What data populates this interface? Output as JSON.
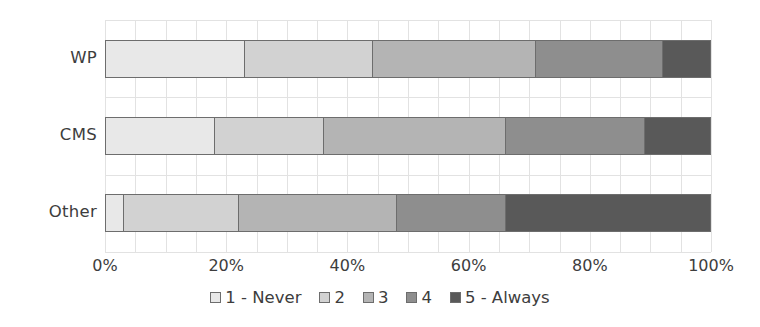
{
  "chart_data": {
    "type": "bar",
    "subtype": "stacked-horizontal-100pct",
    "title": "",
    "xlabel": "",
    "ylabel": "",
    "categories": [
      "WP",
      "CMS",
      "Other"
    ],
    "xlim": [
      0,
      100
    ],
    "xticks": [
      0,
      20,
      40,
      60,
      80,
      100
    ],
    "xtick_labels": [
      "0%",
      "20%",
      "40%",
      "60%",
      "80%",
      "100%"
    ],
    "grid": true,
    "grid_axis": "both",
    "legend_position": "bottom",
    "series": [
      {
        "name": "1 - Never",
        "color": "#e8e8e8",
        "values": [
          23,
          18,
          3
        ]
      },
      {
        "name": "2",
        "color": "#d2d2d2",
        "values": [
          21,
          18,
          19
        ]
      },
      {
        "name": "3",
        "color": "#b4b4b4",
        "values": [
          27,
          30,
          26
        ]
      },
      {
        "name": "4",
        "color": "#8e8e8e",
        "values": [
          21,
          23,
          18
        ]
      },
      {
        "name": "5 - Always",
        "color": "#595959",
        "values": [
          8,
          11,
          34
        ]
      }
    ]
  },
  "legend": {
    "items": [
      {
        "label": "1 - Never",
        "color": "#e8e8e8"
      },
      {
        "label": "2",
        "color": "#d2d2d2"
      },
      {
        "label": "3",
        "color": "#b4b4b4"
      },
      {
        "label": "4",
        "color": "#8e8e8e"
      },
      {
        "label": "5 - Always",
        "color": "#595959"
      }
    ]
  },
  "axis": {
    "x_tick_labels": [
      "0%",
      "20%",
      "40%",
      "60%",
      "80%",
      "100%"
    ],
    "y_tick_labels": [
      "WP",
      "CMS",
      "Other"
    ]
  },
  "style": {
    "bar_border": "#6d6d6d",
    "grid_color": "#e2e2e2",
    "text_color": "#3d3d3d",
    "background": "#ffffff"
  }
}
